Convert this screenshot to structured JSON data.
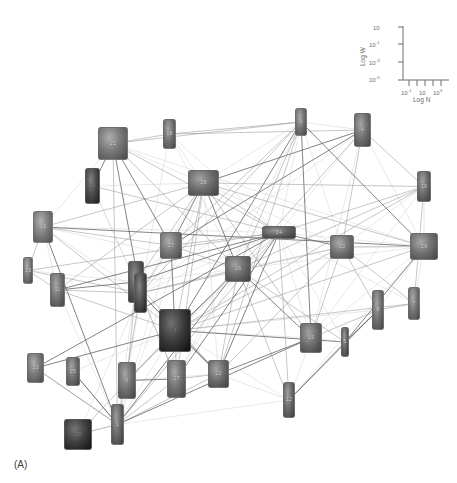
{
  "figure": {
    "caption": "(A)",
    "type": "network-graph",
    "background": "#ffffff"
  },
  "legend": {
    "name": "log-log-inset-axes",
    "y_axis_title": "Log W",
    "x_axis_title": "Log N",
    "y_ticks": [
      "10",
      "10-1",
      "10-3",
      "10-5"
    ],
    "y_tick_bases": [
      "10",
      "10",
      "10",
      "10"
    ],
    "y_tick_exps": [
      "",
      "-1",
      "-3",
      "-5"
    ],
    "x_ticks": [
      "10-1",
      "10",
      "103"
    ],
    "x_tick_bases": [
      "10",
      "10",
      "10"
    ],
    "x_tick_exps": [
      "-1",
      "",
      "3"
    ],
    "axis_color": "#6d6d6d"
  },
  "network": {
    "edge_color_dark": "#5a5a5a",
    "edge_color_mid": "#8f8f8f",
    "edge_color_light": "#c4c4c4",
    "node_fill_light": "#b4b4b4",
    "node_fill_mid": "#8a8a8a",
    "node_fill_dark": "#3a3a3a",
    "node_count": 30,
    "nodes": [
      {
        "id": "n21",
        "label": "21",
        "x": 98,
        "y": 127,
        "w": 30,
        "h": 33,
        "shade": 0.52
      },
      {
        "id": "n19",
        "label": "19",
        "x": 85,
        "y": 168,
        "w": 15,
        "h": 36,
        "shade": 0.22
      },
      {
        "id": "n16",
        "label": "16",
        "x": 33,
        "y": 211,
        "w": 20,
        "h": 32,
        "shade": 0.55
      },
      {
        "id": "n18",
        "label": "18",
        "x": 163,
        "y": 119,
        "w": 13,
        "h": 30,
        "shade": 0.48
      },
      {
        "id": "n28",
        "label": "28",
        "x": 188,
        "y": 170,
        "w": 31,
        "h": 26,
        "shade": 0.45
      },
      {
        "id": "n9",
        "label": "9",
        "x": 295,
        "y": 108,
        "w": 12,
        "h": 28,
        "shade": 0.5
      },
      {
        "id": "n4",
        "label": "4",
        "x": 354,
        "y": 113,
        "w": 17,
        "h": 34,
        "shade": 0.47
      },
      {
        "id": "n10",
        "label": "10",
        "x": 417,
        "y": 171,
        "w": 14,
        "h": 31,
        "shade": 0.44
      },
      {
        "id": "n27",
        "label": "27",
        "x": 160,
        "y": 232,
        "w": 22,
        "h": 27,
        "shade": 0.52
      },
      {
        "id": "n24",
        "label": "24",
        "x": 262,
        "y": 226,
        "w": 34,
        "h": 13,
        "shade": 0.38
      },
      {
        "id": "n20",
        "label": "20",
        "x": 330,
        "y": 235,
        "w": 24,
        "h": 24,
        "shade": 0.5
      },
      {
        "id": "n29",
        "label": "29",
        "x": 410,
        "y": 233,
        "w": 28,
        "h": 27,
        "shade": 0.48
      },
      {
        "id": "n26",
        "label": "26",
        "x": 225,
        "y": 256,
        "w": 26,
        "h": 26,
        "shade": 0.44
      },
      {
        "id": "n11",
        "label": "11",
        "x": 50,
        "y": 273,
        "w": 15,
        "h": 34,
        "shade": 0.48
      },
      {
        "id": "n14",
        "label": "14",
        "x": 128,
        "y": 261,
        "w": 16,
        "h": 42,
        "shade": 0.3
      },
      {
        "id": "n13",
        "label": "13",
        "x": 23,
        "y": 257,
        "w": 10,
        "h": 27,
        "shade": 0.52
      },
      {
        "id": "n7",
        "label": "7",
        "x": 408,
        "y": 287,
        "w": 12,
        "h": 33,
        "shade": 0.5
      },
      {
        "id": "n2",
        "label": "2",
        "x": 134,
        "y": 273,
        "w": 13,
        "h": 40,
        "shade": 0.25
      },
      {
        "id": "n3",
        "label": "3",
        "x": 159,
        "y": 309,
        "w": 32,
        "h": 43,
        "shade": 0.12
      },
      {
        "id": "n15",
        "label": "15",
        "x": 300,
        "y": 323,
        "w": 22,
        "h": 30,
        "shade": 0.45
      },
      {
        "id": "n5",
        "label": "5",
        "x": 341,
        "y": 327,
        "w": 8,
        "h": 30,
        "shade": 0.4
      },
      {
        "id": "n8",
        "label": "8",
        "x": 372,
        "y": 290,
        "w": 12,
        "h": 40,
        "shade": 0.47
      },
      {
        "id": "n23",
        "label": "23",
        "x": 27,
        "y": 353,
        "w": 17,
        "h": 30,
        "shade": 0.52
      },
      {
        "id": "n25",
        "label": "25",
        "x": 66,
        "y": 357,
        "w": 14,
        "h": 29,
        "shade": 0.46
      },
      {
        "id": "n6",
        "label": "6",
        "x": 118,
        "y": 362,
        "w": 18,
        "h": 37,
        "shade": 0.47
      },
      {
        "id": "n17",
        "label": "17",
        "x": 167,
        "y": 360,
        "w": 19,
        "h": 38,
        "shade": 0.48
      },
      {
        "id": "n22",
        "label": "22",
        "x": 208,
        "y": 360,
        "w": 21,
        "h": 28,
        "shade": 0.45
      },
      {
        "id": "n12",
        "label": "12",
        "x": 283,
        "y": 382,
        "w": 12,
        "h": 36,
        "shade": 0.43
      },
      {
        "id": "n1",
        "label": "1",
        "x": 111,
        "y": 404,
        "w": 13,
        "h": 41,
        "shade": 0.42
      },
      {
        "id": "n30",
        "label": "30",
        "x": 64,
        "y": 419,
        "w": 28,
        "h": 31,
        "shade": 0.15
      }
    ],
    "edges": [
      [
        "n1",
        "n2"
      ],
      [
        "n1",
        "n3"
      ],
      [
        "n1",
        "n6"
      ],
      [
        "n1",
        "n14"
      ],
      [
        "n1",
        "n17"
      ],
      [
        "n1",
        "n22"
      ],
      [
        "n1",
        "n11"
      ],
      [
        "n1",
        "n16"
      ],
      [
        "n1",
        "n21"
      ],
      [
        "n1",
        "n27"
      ],
      [
        "n1",
        "n26"
      ],
      [
        "n1",
        "n24"
      ],
      [
        "n1",
        "n28"
      ],
      [
        "n1",
        "n30"
      ],
      [
        "n1",
        "n23"
      ],
      [
        "n1",
        "n25"
      ],
      [
        "n1",
        "n12"
      ],
      [
        "n1",
        "n15"
      ],
      [
        "n2",
        "n3"
      ],
      [
        "n2",
        "n14"
      ],
      [
        "n2",
        "n21"
      ],
      [
        "n2",
        "n27"
      ],
      [
        "n2",
        "n28"
      ],
      [
        "n2",
        "n24"
      ],
      [
        "n2",
        "n26"
      ],
      [
        "n2",
        "n6"
      ],
      [
        "n2",
        "n17"
      ],
      [
        "n2",
        "n22"
      ],
      [
        "n2",
        "n11"
      ],
      [
        "n2",
        "n16"
      ],
      [
        "n2",
        "n9"
      ],
      [
        "n2",
        "n4"
      ],
      [
        "n2",
        "n18"
      ],
      [
        "n2",
        "n19"
      ],
      [
        "n2",
        "n13"
      ],
      [
        "n2",
        "n20"
      ],
      [
        "n3",
        "n24"
      ],
      [
        "n3",
        "n26"
      ],
      [
        "n3",
        "n28"
      ],
      [
        "n3",
        "n15"
      ],
      [
        "n3",
        "n22"
      ],
      [
        "n3",
        "n17"
      ],
      [
        "n3",
        "n6"
      ],
      [
        "n3",
        "n12"
      ],
      [
        "n3",
        "n20"
      ],
      [
        "n3",
        "n29"
      ],
      [
        "n3",
        "n9"
      ],
      [
        "n3",
        "n27"
      ],
      [
        "n3",
        "n8"
      ],
      [
        "n3",
        "n5"
      ],
      [
        "n3",
        "n7"
      ],
      [
        "n3",
        "n10"
      ],
      [
        "n4",
        "n9"
      ],
      [
        "n4",
        "n24"
      ],
      [
        "n4",
        "n10"
      ],
      [
        "n4",
        "n20"
      ],
      [
        "n4",
        "n29"
      ],
      [
        "n4",
        "n28"
      ],
      [
        "n4",
        "n26"
      ],
      [
        "n4",
        "n15"
      ],
      [
        "n4",
        "n27"
      ],
      [
        "n4",
        "n18"
      ],
      [
        "n5",
        "n15"
      ],
      [
        "n5",
        "n24"
      ],
      [
        "n5",
        "n26"
      ],
      [
        "n5",
        "n12"
      ],
      [
        "n5",
        "n8"
      ],
      [
        "n5",
        "n29"
      ],
      [
        "n6",
        "n14"
      ],
      [
        "n6",
        "n22"
      ],
      [
        "n6",
        "n17"
      ],
      [
        "n6",
        "n26"
      ],
      [
        "n6",
        "n24"
      ],
      [
        "n7",
        "n29"
      ],
      [
        "n7",
        "n10"
      ],
      [
        "n7",
        "n20"
      ],
      [
        "n7",
        "n24"
      ],
      [
        "n7",
        "n8"
      ],
      [
        "n8",
        "n15"
      ],
      [
        "n8",
        "n29"
      ],
      [
        "n8",
        "n12"
      ],
      [
        "n8",
        "n20"
      ],
      [
        "n9",
        "n24"
      ],
      [
        "n9",
        "n28"
      ],
      [
        "n9",
        "n26"
      ],
      [
        "n9",
        "n27"
      ],
      [
        "n9",
        "n20"
      ],
      [
        "n9",
        "n29"
      ],
      [
        "n9",
        "n22"
      ],
      [
        "n9",
        "n17"
      ],
      [
        "n9",
        "n15"
      ],
      [
        "n9",
        "n21"
      ],
      [
        "n10",
        "n24"
      ],
      [
        "n10",
        "n20"
      ],
      [
        "n10",
        "n29"
      ],
      [
        "n10",
        "n26"
      ],
      [
        "n10",
        "n28"
      ],
      [
        "n10",
        "n15"
      ],
      [
        "n11",
        "n14"
      ],
      [
        "n11",
        "n13"
      ],
      [
        "n11",
        "n16"
      ],
      [
        "n11",
        "n24"
      ],
      [
        "n11",
        "n28"
      ],
      [
        "n12",
        "n15"
      ],
      [
        "n12",
        "n22"
      ],
      [
        "n12",
        "n24"
      ],
      [
        "n12",
        "n26"
      ],
      [
        "n12",
        "n29"
      ],
      [
        "n12",
        "n5"
      ],
      [
        "n13",
        "n16"
      ],
      [
        "n13",
        "n14"
      ],
      [
        "n14",
        "n24"
      ],
      [
        "n14",
        "n28"
      ],
      [
        "n14",
        "n26"
      ],
      [
        "n14",
        "n27"
      ],
      [
        "n14",
        "n22"
      ],
      [
        "n14",
        "n17"
      ],
      [
        "n15",
        "n24"
      ],
      [
        "n15",
        "n26"
      ],
      [
        "n15",
        "n20"
      ],
      [
        "n15",
        "n29"
      ],
      [
        "n15",
        "n22"
      ],
      [
        "n15",
        "n28"
      ],
      [
        "n16",
        "n21"
      ],
      [
        "n16",
        "n24"
      ],
      [
        "n16",
        "n28"
      ],
      [
        "n16",
        "n27"
      ],
      [
        "n16",
        "n26"
      ],
      [
        "n16",
        "n29"
      ],
      [
        "n17",
        "n22"
      ],
      [
        "n17",
        "n26"
      ],
      [
        "n17",
        "n24"
      ],
      [
        "n17",
        "n28"
      ],
      [
        "n18",
        "n24"
      ],
      [
        "n18",
        "n28"
      ],
      [
        "n18",
        "n9"
      ],
      [
        "n18",
        "n21"
      ],
      [
        "n18",
        "n26"
      ],
      [
        "n19",
        "n21"
      ],
      [
        "n19",
        "n24"
      ],
      [
        "n19",
        "n28"
      ],
      [
        "n20",
        "n24"
      ],
      [
        "n20",
        "n29"
      ],
      [
        "n20",
        "n26"
      ],
      [
        "n20",
        "n28"
      ],
      [
        "n20",
        "n22"
      ],
      [
        "n21",
        "n24"
      ],
      [
        "n21",
        "n28"
      ],
      [
        "n21",
        "n27"
      ],
      [
        "n21",
        "n26"
      ],
      [
        "n21",
        "n29"
      ],
      [
        "n22",
        "n24"
      ],
      [
        "n22",
        "n26"
      ],
      [
        "n22",
        "n28"
      ],
      [
        "n24",
        "n26"
      ],
      [
        "n24",
        "n27"
      ],
      [
        "n24",
        "n28"
      ],
      [
        "n24",
        "n29"
      ],
      [
        "n26",
        "n28"
      ],
      [
        "n26",
        "n27"
      ],
      [
        "n26",
        "n29"
      ],
      [
        "n27",
        "n28"
      ],
      [
        "n28",
        "n29"
      ],
      [
        "n29",
        "n20"
      ],
      [
        "n30",
        "n1"
      ],
      [
        "n30",
        "n3"
      ],
      [
        "n30",
        "n2"
      ],
      [
        "n23",
        "n3"
      ],
      [
        "n23",
        "n24"
      ],
      [
        "n25",
        "n3"
      ],
      [
        "n25",
        "n1"
      ],
      [
        "n23",
        "n1"
      ],
      [
        "n13",
        "n24"
      ],
      [
        "n19",
        "n2"
      ],
      [
        "n11",
        "n3"
      ],
      [
        "n16",
        "n3"
      ]
    ]
  }
}
